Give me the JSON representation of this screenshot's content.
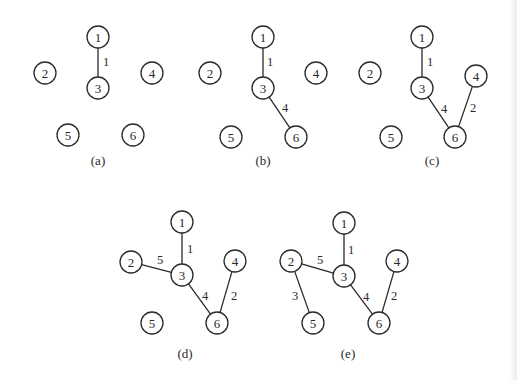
{
  "figure": {
    "node_radius": 11,
    "panels": [
      {
        "caption": "(a)",
        "caption_pos": [
          98,
          160
        ],
        "nodes": [
          {
            "id": "1",
            "x": 98,
            "y": 37
          },
          {
            "id": "2",
            "x": 45,
            "y": 73
          },
          {
            "id": "3",
            "x": 98,
            "y": 88
          },
          {
            "id": "4",
            "x": 152,
            "y": 73
          },
          {
            "id": "5",
            "x": 68,
            "y": 135
          },
          {
            "id": "6",
            "x": 133,
            "y": 135
          }
        ],
        "edges": [
          {
            "from": "1",
            "to": "3",
            "weight": "1",
            "label_pos": [
              106,
              62
            ]
          }
        ]
      },
      {
        "caption": "(b)",
        "caption_pos": [
          263,
          160
        ],
        "nodes": [
          {
            "id": "1",
            "x": 263,
            "y": 37
          },
          {
            "id": "2",
            "x": 210,
            "y": 73
          },
          {
            "id": "3",
            "x": 263,
            "y": 88
          },
          {
            "id": "4",
            "x": 316,
            "y": 73
          },
          {
            "id": "5",
            "x": 231,
            "y": 137
          },
          {
            "id": "6",
            "x": 296,
            "y": 137
          }
        ],
        "edges": [
          {
            "from": "1",
            "to": "3",
            "weight": "1",
            "label_pos": [
              270,
              62
            ]
          },
          {
            "from": "3",
            "to": "6",
            "weight": "4",
            "label_pos": [
              285,
              108
            ]
          }
        ]
      },
      {
        "caption": "(c)",
        "caption_pos": [
          432,
          160
        ],
        "nodes": [
          {
            "id": "1",
            "x": 422,
            "y": 37
          },
          {
            "id": "2",
            "x": 370,
            "y": 73
          },
          {
            "id": "3",
            "x": 422,
            "y": 88
          },
          {
            "id": "4",
            "x": 476,
            "y": 76
          },
          {
            "id": "5",
            "x": 391,
            "y": 137
          },
          {
            "id": "6",
            "x": 455,
            "y": 137
          }
        ],
        "edges": [
          {
            "from": "1",
            "to": "3",
            "weight": "1",
            "label_pos": [
              430,
              62
            ]
          },
          {
            "from": "3",
            "to": "6",
            "weight": "4",
            "label_pos": [
              444,
              109
            ]
          },
          {
            "from": "4",
            "to": "6",
            "weight": "2",
            "label_pos": [
              473,
              108
            ]
          }
        ]
      },
      {
        "caption": "(d)",
        "caption_pos": [
          185,
          353
        ],
        "nodes": [
          {
            "id": "1",
            "x": 182,
            "y": 222
          },
          {
            "id": "2",
            "x": 131,
            "y": 262
          },
          {
            "id": "3",
            "x": 182,
            "y": 275
          },
          {
            "id": "4",
            "x": 235,
            "y": 261
          },
          {
            "id": "5",
            "x": 152,
            "y": 323
          },
          {
            "id": "6",
            "x": 217,
            "y": 323
          }
        ],
        "edges": [
          {
            "from": "1",
            "to": "3",
            "weight": "1",
            "label_pos": [
              190,
              249
            ]
          },
          {
            "from": "2",
            "to": "3",
            "weight": "5",
            "label_pos": [
              160,
              260
            ]
          },
          {
            "from": "3",
            "to": "6",
            "weight": "4",
            "label_pos": [
              205,
              296
            ]
          },
          {
            "from": "4",
            "to": "6",
            "weight": "2",
            "label_pos": [
              234,
              296
            ]
          }
        ]
      },
      {
        "caption": "(e)",
        "caption_pos": [
          348,
          353
        ],
        "nodes": [
          {
            "id": "1",
            "x": 344,
            "y": 223
          },
          {
            "id": "2",
            "x": 291,
            "y": 261
          },
          {
            "id": "3",
            "x": 344,
            "y": 276
          },
          {
            "id": "4",
            "x": 397,
            "y": 261
          },
          {
            "id": "5",
            "x": 313,
            "y": 323
          },
          {
            "id": "6",
            "x": 379,
            "y": 323
          }
        ],
        "edges": [
          {
            "from": "1",
            "to": "3",
            "weight": "1",
            "label_pos": [
              351,
              250
            ]
          },
          {
            "from": "2",
            "to": "3",
            "weight": "5",
            "label_pos": [
              320,
              260
            ]
          },
          {
            "from": "2",
            "to": "5",
            "weight": "3",
            "label_pos": [
              295,
              296
            ]
          },
          {
            "from": "3",
            "to": "6",
            "weight": "4",
            "label_pos": [
              366,
              297
            ]
          },
          {
            "from": "4",
            "to": "6",
            "weight": "2",
            "label_pos": [
              394,
              296
            ]
          }
        ]
      }
    ]
  }
}
